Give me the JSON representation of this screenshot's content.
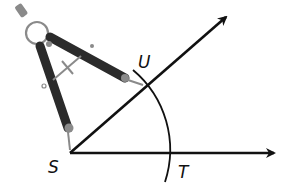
{
  "figure": {
    "colors": {
      "background": "#ffffff",
      "lines": "#111111",
      "compass_dark": "#2b2b2b",
      "compass_light": "#8a8a8a"
    },
    "points": {
      "vertex": {
        "label": "S",
        "x": 70,
        "y": 153
      },
      "upper": {
        "label": "U",
        "x": 148,
        "y": 84
      },
      "lower": {
        "label": "T",
        "x": 174,
        "y": 153
      }
    },
    "rays": [
      {
        "name": "ray-SU",
        "from": [
          70,
          153
        ],
        "to": [
          228,
          15
        ]
      },
      {
        "name": "ray-ST",
        "from": [
          70,
          153
        ],
        "to": [
          277,
          153
        ]
      }
    ],
    "arc": {
      "center": [
        70,
        153
      ],
      "radius": 104
    },
    "labels": {
      "S": "S",
      "U": "U",
      "T": "T"
    },
    "tool_icon": "compass-icon"
  }
}
